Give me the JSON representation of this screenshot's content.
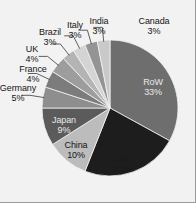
{
  "chart_data": {
    "type": "pie",
    "title": "",
    "subtitle": "",
    "xlabel": "",
    "ylabel": "",
    "legend_position": "none",
    "grid": false,
    "units": "percent",
    "categories": [
      "RoW",
      "US",
      "China",
      "Japan",
      "Germany",
      "France",
      "UK",
      "Brazil",
      "Italy",
      "India",
      "Canada"
    ],
    "values": [
      33,
      23,
      10,
      9,
      5,
      4,
      4,
      3,
      3,
      3,
      3
    ],
    "slices": [
      {
        "label": "RoW",
        "pct": 33,
        "text": "RoW",
        "pct_text": "33%",
        "color": "#6e6e6e",
        "label_placement": "inside"
      },
      {
        "label": "US",
        "pct": 23,
        "text": "US",
        "pct_text": "23%",
        "color": "#1d1d1d",
        "label_placement": "inside"
      },
      {
        "label": "China",
        "pct": 10,
        "text": "China",
        "pct_text": "10%",
        "color": "#bcbcbc",
        "label_placement": "inside"
      },
      {
        "label": "Japan",
        "pct": 9,
        "text": "Japan",
        "pct_text": "9%",
        "color": "#5b5b5b",
        "label_placement": "inside"
      },
      {
        "label": "Germany",
        "pct": 5,
        "text": "Germany",
        "pct_text": "5%",
        "color": "#8e8e8e",
        "label_placement": "outside"
      },
      {
        "label": "France",
        "pct": 4,
        "text": "France",
        "pct_text": "4%",
        "color": "#7c7c7c",
        "label_placement": "outside"
      },
      {
        "label": "UK",
        "pct": 4,
        "text": "UK",
        "pct_text": "4%",
        "color": "#9d9d9d",
        "label_placement": "outside"
      },
      {
        "label": "Brazil",
        "pct": 3,
        "text": "Brazil",
        "pct_text": "3%",
        "color": "#b4b4b4",
        "label_placement": "outside"
      },
      {
        "label": "Italy",
        "pct": 3,
        "text": "Italy",
        "pct_text": "3%",
        "color": "#d4d4d4",
        "label_placement": "outside"
      },
      {
        "label": "India",
        "pct": 3,
        "text": "India",
        "pct_text": "3%",
        "color": "#949494",
        "label_placement": "outside"
      },
      {
        "label": "Canada",
        "pct": 3,
        "text": "Canada",
        "pct_text": "3%",
        "color": "#c9c9c9",
        "label_placement": "outside"
      }
    ],
    "geometry": {
      "center_x": 110,
      "center_y": 108,
      "radius": 68,
      "start_angle_deg": -90,
      "direction": "clockwise"
    },
    "style": {
      "background": "#f2f2f2",
      "label_color": "#151515",
      "leader_color": "#3a3a3a",
      "slice_edge": "#f2f2f2"
    }
  }
}
